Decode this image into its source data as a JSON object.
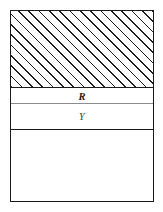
{
  "figure": {
    "type": "layered-cross-section-diagram",
    "caption": "",
    "background_color": "#ffffff",
    "frame": {
      "stroke_color": "#1b1b1b",
      "stroke_width_px": 1.6,
      "fill_color": "#ffffff"
    },
    "bands": [
      {
        "id": "band-hatched",
        "label": "",
        "fill": "diagonal-hatch",
        "hatch_angle_deg": 45,
        "hatch_spacing_px": 7.3,
        "hatch_color": "#1f1f1f",
        "bottom_rule_color": "#1b1b1b",
        "bottom_rule_width_px": 1.6
      },
      {
        "id": "band-r",
        "label": "R",
        "fill": "none",
        "bottom_rule_color": "#8c8c8c",
        "bottom_rule_width_px": 1.3
      },
      {
        "id": "band-y",
        "label": "Y",
        "fill": "none",
        "bottom_rule_color": "#1b1b1b",
        "bottom_rule_width_px": 1.6
      },
      {
        "id": "band-empty",
        "label": "",
        "fill": "none",
        "bottom_rule_color": "",
        "bottom_rule_width_px": 0
      }
    ]
  }
}
